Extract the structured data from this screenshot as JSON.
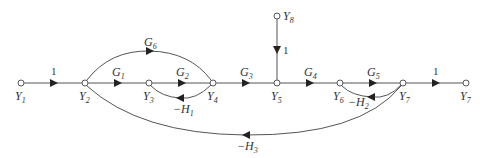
{
  "diagram": {
    "type": "signal-flow-graph",
    "nodes": [
      {
        "id": "Y1",
        "base": "Y",
        "sub": "1",
        "x": 21,
        "y": 83,
        "lx": 15,
        "ly": 100
      },
      {
        "id": "Y2",
        "base": "Y",
        "sub": "2",
        "x": 85,
        "y": 83,
        "lx": 79,
        "ly": 100
      },
      {
        "id": "Y3",
        "base": "Y",
        "sub": "3",
        "x": 149,
        "y": 83,
        "lx": 143,
        "ly": 100
      },
      {
        "id": "Y4",
        "base": "Y",
        "sub": "4",
        "x": 213,
        "y": 83,
        "lx": 207,
        "ly": 100
      },
      {
        "id": "Y5",
        "base": "Y",
        "sub": "5",
        "x": 277,
        "y": 83,
        "lx": 271,
        "ly": 100
      },
      {
        "id": "Y6",
        "base": "Y",
        "sub": "6",
        "x": 340,
        "y": 83,
        "lx": 333,
        "ly": 100
      },
      {
        "id": "Y7a",
        "base": "Y",
        "sub": "7",
        "x": 403,
        "y": 83,
        "lx": 399,
        "ly": 100
      },
      {
        "id": "Y7b",
        "base": "Y",
        "sub": "7",
        "x": 466,
        "y": 83,
        "lx": 460,
        "ly": 100
      },
      {
        "id": "Y8",
        "base": "Y",
        "sub": "8",
        "x": 277,
        "y": 16,
        "lx": 283,
        "ly": 20
      }
    ],
    "edges": [
      {
        "from": "Y1",
        "to": "Y2",
        "gain_base": "1",
        "gain_sub": "",
        "is_number": true
      },
      {
        "from": "Y2",
        "to": "Y3",
        "gain_base": "G",
        "gain_sub": "1"
      },
      {
        "from": "Y3",
        "to": "Y4",
        "gain_base": "G",
        "gain_sub": "2"
      },
      {
        "from": "Y4",
        "to": "Y3",
        "gain_base": "−H",
        "gain_sub": "1"
      },
      {
        "from": "Y2",
        "to": "Y4",
        "gain_base": "G",
        "gain_sub": "6"
      },
      {
        "from": "Y4",
        "to": "Y5",
        "gain_base": "G",
        "gain_sub": "3"
      },
      {
        "from": "Y8",
        "to": "Y5",
        "gain_base": "1",
        "gain_sub": "",
        "is_number": true
      },
      {
        "from": "Y5",
        "to": "Y6",
        "gain_base": "G",
        "gain_sub": "4"
      },
      {
        "from": "Y6",
        "to": "Y7a",
        "gain_base": "G",
        "gain_sub": "5"
      },
      {
        "from": "Y7a",
        "to": "Y6",
        "gain_base": "−H",
        "gain_sub": "2"
      },
      {
        "from": "Y7a",
        "to": "Y7b",
        "gain_base": "1",
        "gain_sub": "",
        "is_number": true
      },
      {
        "from": "Y7a",
        "to": "Y2",
        "gain_base": "−H",
        "gain_sub": "3"
      }
    ]
  }
}
